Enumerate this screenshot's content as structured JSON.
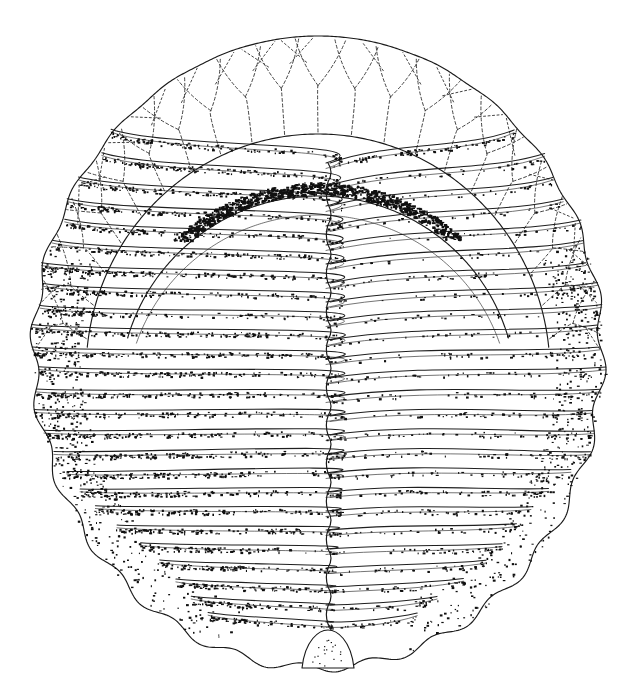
{
  "figure": {
    "kind": "scientific-illustration",
    "technique": "pen-and-ink stipple drawing",
    "caption": "",
    "label": "",
    "background_color": "#ffffff",
    "ink_color": "#101010",
    "canvas": {
      "width": 632,
      "height": 691
    }
  },
  "geometry": {
    "body_outline": {
      "center_x": 318,
      "center_y": 352,
      "radius_x": 284,
      "radius_y": 316,
      "top_y": 38,
      "bottom_y": 668,
      "left_x": 34,
      "right_x": 601,
      "scallop_count": 26,
      "scallop_depth": 4.5
    },
    "axis": {
      "midline_x": 328,
      "midline_top_y": 163,
      "midline_bottom_y": 636,
      "zigzag_amplitude": 6
    },
    "cephalon": {
      "rim_outer_top_y": 40,
      "rim_inner_arc_cx": 318,
      "rim_inner_arc_cy": 372,
      "rim_inner_rx": 232,
      "rim_inner_ry": 238,
      "rim_band_width": 58,
      "doublure_arc_cx": 318,
      "doublure_arc_cy": 392,
      "doublure_rx": 198,
      "doublure_ry": 196
    }
  },
  "terrace_lines": {
    "description": "dendritic branching terrace lines on the cephalic rim",
    "count": 21,
    "angle_start_deg": 188,
    "angle_end_deg": 352,
    "branch_levels": 2,
    "stroke_color": "#3a3a3a",
    "dash_pattern": "3 2.5"
  },
  "ribs": {
    "description": "thoracic pleural ribs curving from the sagittal midline outward to the scalloped margin",
    "count": 25,
    "left_shading": "heavy-stipple",
    "right_shading": "light-stipple",
    "band_color": "#101010",
    "first_rib_y": 163,
    "last_rib_y": 636,
    "segments": [
      {
        "index": 1,
        "y": 163,
        "left_density": 1.0,
        "right_density": 0.92
      },
      {
        "index": 2,
        "y": 185,
        "left_density": 0.95,
        "right_density": 0.4
      },
      {
        "index": 3,
        "y": 206,
        "left_density": 0.92,
        "right_density": 0.34
      },
      {
        "index": 4,
        "y": 226,
        "left_density": 0.9,
        "right_density": 0.32
      },
      {
        "index": 5,
        "y": 245,
        "left_density": 0.88,
        "right_density": 0.32
      },
      {
        "index": 6,
        "y": 264,
        "left_density": 0.87,
        "right_density": 0.33
      },
      {
        "index": 7,
        "y": 283,
        "left_density": 0.86,
        "right_density": 0.34
      },
      {
        "index": 8,
        "y": 302,
        "left_density": 0.86,
        "right_density": 0.35
      },
      {
        "index": 9,
        "y": 321,
        "left_density": 0.86,
        "right_density": 0.36
      },
      {
        "index": 10,
        "y": 340,
        "left_density": 0.87,
        "right_density": 0.37
      },
      {
        "index": 11,
        "y": 359,
        "left_density": 0.88,
        "right_density": 0.38
      },
      {
        "index": 12,
        "y": 378,
        "left_density": 0.89,
        "right_density": 0.39
      },
      {
        "index": 13,
        "y": 397,
        "left_density": 0.9,
        "right_density": 0.4
      },
      {
        "index": 14,
        "y": 416,
        "left_density": 0.91,
        "right_density": 0.41
      },
      {
        "index": 15,
        "y": 435,
        "left_density": 0.92,
        "right_density": 0.42
      },
      {
        "index": 16,
        "y": 454,
        "left_density": 0.93,
        "right_density": 0.43
      },
      {
        "index": 17,
        "y": 473,
        "left_density": 0.94,
        "right_density": 0.44
      },
      {
        "index": 18,
        "y": 492,
        "left_density": 0.95,
        "right_density": 0.46
      },
      {
        "index": 19,
        "y": 511,
        "left_density": 0.96,
        "right_density": 0.48
      },
      {
        "index": 20,
        "y": 530,
        "left_density": 0.97,
        "right_density": 0.5
      },
      {
        "index": 21,
        "y": 549,
        "left_density": 0.98,
        "right_density": 0.53
      },
      {
        "index": 22,
        "y": 568,
        "left_density": 0.99,
        "right_density": 0.56
      },
      {
        "index": 23,
        "y": 587,
        "left_density": 1.0,
        "right_density": 0.6
      },
      {
        "index": 24,
        "y": 605,
        "left_density": 1.0,
        "right_density": 0.64
      },
      {
        "index": 25,
        "y": 622,
        "left_density": 1.0,
        "right_density": 0.68
      }
    ]
  },
  "terminal_plate": {
    "description": "small terminal axial plate (pygidial tip) at the base of the midline",
    "center_x": 328,
    "top_y": 630,
    "bottom_y": 668,
    "half_width": 26,
    "stipple_density": 0.22
  },
  "margin_shading": {
    "description": "dense stipple shading concentrated along the left and right lateral margins",
    "left_intensity": 0.95,
    "right_intensity": 0.8,
    "band_inset": 46
  }
}
